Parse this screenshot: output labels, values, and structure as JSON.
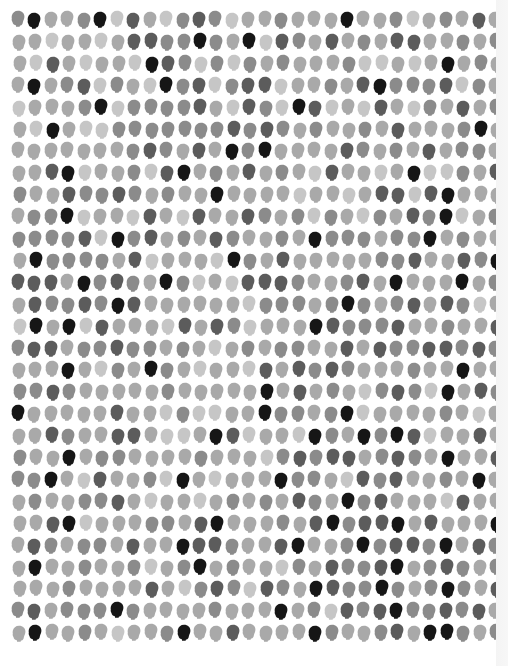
{
  "artwork": {
    "title": "Grid of grayscale head silhouettes",
    "rows": 29,
    "cols": 30,
    "origin_x": 12,
    "origin_y": 11,
    "pitch_x": 16.45,
    "pitch_y": 21.9,
    "background": "#ffffff",
    "shade_palette": [
      "#c6c6c6",
      "#a9a9a9",
      "#8b8b8b",
      "#5c5c5c",
      "#161616"
    ],
    "icon": "head-silhouette-icon",
    "grid": [
      [
        2,
        4,
        1,
        1,
        2,
        4,
        0,
        3,
        1,
        0,
        2,
        3,
        2,
        0,
        1,
        1,
        2,
        1,
        1,
        1,
        4,
        1,
        1,
        2,
        0,
        1,
        2,
        1,
        3,
        1
      ],
      [
        1,
        1,
        0,
        1,
        1,
        0,
        1,
        3,
        3,
        2,
        2,
        4,
        2,
        1,
        4,
        0,
        3,
        2,
        1,
        3,
        1,
        2,
        1,
        3,
        3,
        1,
        1,
        2,
        1,
        2
      ],
      [
        1,
        0,
        3,
        1,
        0,
        1,
        1,
        0,
        4,
        3,
        2,
        0,
        2,
        0,
        2,
        1,
        2,
        1,
        1,
        1,
        2,
        0,
        0,
        1,
        0,
        1,
        4,
        1,
        2,
        1
      ],
      [
        1,
        4,
        1,
        2,
        3,
        0,
        2,
        1,
        0,
        4,
        2,
        3,
        0,
        2,
        3,
        3,
        0,
        1,
        1,
        2,
        1,
        3,
        4,
        2,
        2,
        2,
        3,
        0,
        2,
        1
      ],
      [
        0,
        1,
        1,
        1,
        2,
        4,
        0,
        2,
        2,
        2,
        2,
        3,
        1,
        0,
        3,
        2,
        0,
        4,
        3,
        0,
        1,
        0,
        3,
        1,
        0,
        2,
        1,
        3,
        1,
        2
      ],
      [
        1,
        0,
        4,
        1,
        0,
        0,
        2,
        2,
        2,
        2,
        2,
        2,
        2,
        3,
        2,
        3,
        2,
        1,
        2,
        1,
        1,
        2,
        1,
        3,
        1,
        1,
        1,
        2,
        4,
        1
      ],
      [
        1,
        1,
        1,
        1,
        1,
        1,
        1,
        2,
        3,
        2,
        1,
        3,
        1,
        4,
        2,
        4,
        1,
        1,
        1,
        1,
        3,
        2,
        1,
        2,
        1,
        3,
        1,
        2,
        2,
        1
      ],
      [
        1,
        1,
        3,
        4,
        0,
        1,
        1,
        2,
        0,
        3,
        4,
        1,
        2,
        1,
        3,
        1,
        2,
        1,
        0,
        3,
        1,
        1,
        0,
        1,
        4,
        0,
        0,
        2,
        1,
        3
      ],
      [
        2,
        1,
        1,
        3,
        2,
        2,
        3,
        2,
        1,
        2,
        1,
        1,
        4,
        1,
        1,
        1,
        1,
        0,
        1,
        1,
        0,
        1,
        3,
        3,
        0,
        3,
        4,
        1,
        1,
        1
      ],
      [
        1,
        2,
        2,
        4,
        0,
        1,
        1,
        0,
        3,
        1,
        0,
        3,
        1,
        1,
        3,
        2,
        1,
        2,
        0,
        2,
        1,
        0,
        2,
        1,
        3,
        2,
        4,
        0,
        1,
        2
      ],
      [
        2,
        2,
        2,
        2,
        3,
        0,
        4,
        2,
        3,
        1,
        2,
        1,
        3,
        2,
        1,
        1,
        2,
        1,
        4,
        2,
        2,
        2,
        1,
        2,
        2,
        4,
        1,
        2,
        1,
        1
      ],
      [
        1,
        4,
        2,
        2,
        2,
        2,
        1,
        3,
        0,
        1,
        1,
        1,
        0,
        4,
        2,
        1,
        3,
        1,
        1,
        1,
        1,
        1,
        2,
        2,
        3,
        1,
        1,
        3,
        2,
        4
      ],
      [
        3,
        3,
        3,
        1,
        4,
        2,
        3,
        2,
        1,
        4,
        2,
        0,
        1,
        0,
        3,
        3,
        3,
        2,
        1,
        1,
        2,
        3,
        1,
        4,
        1,
        1,
        1,
        4,
        1,
        2
      ],
      [
        1,
        3,
        2,
        2,
        3,
        2,
        4,
        3,
        1,
        1,
        1,
        1,
        1,
        1,
        0,
        2,
        2,
        2,
        1,
        2,
        4,
        2,
        1,
        2,
        3,
        1,
        3,
        2,
        0,
        1
      ],
      [
        0,
        4,
        1,
        4,
        0,
        3,
        1,
        1,
        1,
        0,
        3,
        1,
        3,
        2,
        0,
        1,
        1,
        1,
        4,
        3,
        2,
        2,
        2,
        3,
        1,
        1,
        2,
        1,
        1,
        3
      ],
      [
        2,
        3,
        3,
        1,
        2,
        2,
        3,
        2,
        2,
        1,
        2,
        1,
        0,
        1,
        2,
        1,
        2,
        2,
        1,
        1,
        3,
        1,
        3,
        2,
        2,
        3,
        3,
        2,
        3,
        2
      ],
      [
        1,
        1,
        1,
        4,
        1,
        0,
        2,
        1,
        4,
        2,
        1,
        0,
        1,
        1,
        0,
        3,
        1,
        3,
        2,
        3,
        2,
        1,
        1,
        1,
        2,
        1,
        1,
        4,
        1,
        1
      ],
      [
        2,
        2,
        3,
        2,
        1,
        1,
        1,
        1,
        1,
        2,
        1,
        1,
        1,
        1,
        1,
        4,
        1,
        3,
        1,
        2,
        1,
        0,
        2,
        3,
        2,
        0,
        4,
        1,
        3,
        2
      ],
      [
        4,
        1,
        1,
        1,
        1,
        1,
        3,
        1,
        1,
        0,
        2,
        0,
        0,
        1,
        1,
        4,
        2,
        2,
        1,
        2,
        4,
        0,
        1,
        1,
        1,
        1,
        2,
        1,
        0,
        1
      ],
      [
        1,
        1,
        3,
        2,
        1,
        1,
        3,
        3,
        1,
        0,
        0,
        1,
        4,
        3,
        0,
        1,
        1,
        0,
        4,
        2,
        1,
        4,
        2,
        4,
        3,
        0,
        1,
        1,
        3,
        1
      ],
      [
        2,
        1,
        1,
        4,
        1,
        2,
        2,
        1,
        1,
        1,
        1,
        2,
        1,
        1,
        1,
        0,
        2,
        3,
        2,
        3,
        3,
        1,
        2,
        3,
        2,
        1,
        4,
        1,
        1,
        3
      ],
      [
        2,
        2,
        4,
        1,
        0,
        3,
        1,
        1,
        2,
        0,
        4,
        1,
        0,
        1,
        1,
        1,
        4,
        2,
        2,
        1,
        0,
        3,
        2,
        3,
        1,
        1,
        2,
        1,
        4,
        1
      ],
      [
        1,
        2,
        1,
        1,
        2,
        2,
        3,
        1,
        0,
        1,
        1,
        0,
        1,
        2,
        1,
        2,
        1,
        3,
        2,
        1,
        4,
        2,
        3,
        1,
        1,
        1,
        0,
        3,
        1,
        1
      ],
      [
        1,
        1,
        3,
        4,
        0,
        1,
        1,
        1,
        2,
        2,
        1,
        3,
        4,
        1,
        1,
        1,
        2,
        1,
        3,
        4,
        2,
        3,
        3,
        4,
        1,
        3,
        1,
        1,
        1,
        4
      ],
      [
        1,
        3,
        2,
        1,
        2,
        2,
        1,
        3,
        1,
        1,
        4,
        3,
        3,
        2,
        1,
        1,
        3,
        4,
        1,
        1,
        2,
        4,
        2,
        3,
        3,
        2,
        4,
        1,
        3,
        2
      ],
      [
        1,
        4,
        1,
        1,
        2,
        1,
        1,
        2,
        0,
        1,
        2,
        4,
        1,
        2,
        1,
        1,
        0,
        2,
        1,
        3,
        2,
        2,
        3,
        4,
        1,
        2,
        3,
        2,
        1,
        2
      ],
      [
        1,
        1,
        1,
        2,
        1,
        1,
        1,
        1,
        3,
        1,
        0,
        2,
        3,
        2,
        0,
        3,
        2,
        1,
        4,
        3,
        2,
        2,
        4,
        2,
        1,
        2,
        4,
        2,
        1,
        3
      ],
      [
        2,
        3,
        1,
        2,
        2,
        2,
        4,
        2,
        1,
        1,
        1,
        1,
        2,
        1,
        1,
        1,
        4,
        1,
        2,
        0,
        3,
        2,
        3,
        4,
        2,
        2,
        3,
        2,
        3,
        1
      ],
      [
        1,
        4,
        1,
        1,
        2,
        1,
        0,
        1,
        1,
        2,
        4,
        1,
        1,
        3,
        1,
        1,
        1,
        1,
        4,
        2,
        1,
        1,
        2,
        3,
        1,
        4,
        4,
        2,
        1,
        2
      ]
    ]
  }
}
